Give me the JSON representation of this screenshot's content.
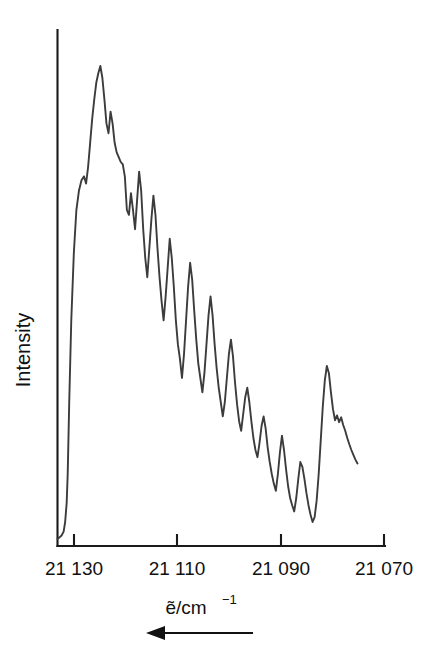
{
  "chart_data": {
    "type": "line",
    "title": "",
    "subtitle": "",
    "xlabel": "ṽ/cm⁻¹",
    "xlabel_base": "ẽ/cm",
    "xlabel_exponent": "−1",
    "ylabel": "Intensity",
    "grid": false,
    "legend": null,
    "annotations": [
      {
        "name": "axis-direction-arrow",
        "text": "",
        "meaning": "arrow pointing left, indicating decreasing wavenumber to the right"
      }
    ],
    "x_axis": {
      "tick_labels": [
        "21 130",
        "21 110",
        "21 090",
        "21 070"
      ],
      "tick_values": [
        21130,
        21110,
        21090,
        21070
      ],
      "reversed": true,
      "xlim": [
        21132,
        21068
      ],
      "units": "cm^-1"
    },
    "y_axis": {
      "ylim": [
        0,
        1
      ],
      "tick_labels": [],
      "units": "arbitrary"
    },
    "series": [
      {
        "name": "emission-spectrum",
        "color": "#3c3c3c",
        "x": [
          21132.0,
          21131.6,
          21131.2,
          21130.8,
          21130.5,
          21130.2,
          21130.0,
          21129.7,
          21129.3,
          21128.8,
          21128.3,
          21127.8,
          21127.3,
          21126.8,
          21126.4,
          21126.0,
          21125.6,
          21125.2,
          21124.8,
          21124.4,
          21124.0,
          21123.6,
          21123.2,
          21122.8,
          21122.4,
          21122.0,
          21121.6,
          21121.2,
          21120.8,
          21120.4,
          21120.0,
          21119.6,
          21119.2,
          21118.8,
          21118.4,
          21118.0,
          21117.6,
          21117.2,
          21116.8,
          21116.4,
          21116.0,
          21115.6,
          21115.2,
          21114.8,
          21114.4,
          21114.0,
          21113.6,
          21113.2,
          21112.8,
          21112.4,
          21112.0,
          21111.6,
          21111.2,
          21110.8,
          21110.4,
          21110.0,
          21109.6,
          21109.2,
          21108.8,
          21108.4,
          21108.0,
          21107.6,
          21107.2,
          21106.8,
          21106.4,
          21106.0,
          21105.6,
          21105.2,
          21104.8,
          21104.4,
          21104.0,
          21103.6,
          21103.2,
          21102.8,
          21102.4,
          21102.0,
          21101.6,
          21101.2,
          21100.8,
          21100.4,
          21100.0,
          21099.6,
          21099.2,
          21098.8,
          21098.4,
          21098.0,
          21097.6,
          21097.2,
          21096.8,
          21096.4,
          21096.0,
          21095.6,
          21095.2,
          21094.8,
          21094.4,
          21094.0,
          21093.6,
          21093.2,
          21092.8,
          21092.4,
          21092.0,
          21091.6,
          21091.2,
          21090.8,
          21090.4,
          21090.0,
          21089.6,
          21089.2,
          21088.8,
          21088.4,
          21088.0,
          21087.6,
          21087.2,
          21086.8,
          21086.4,
          21086.0,
          21085.6,
          21085.2,
          21084.8,
          21084.4,
          21084.0,
          21083.6,
          21083.2,
          21082.8,
          21082.4,
          21082.0,
          21081.6,
          21081.2,
          21080.8,
          21080.4,
          21080.0,
          21079.6,
          21079.2,
          21078.8,
          21078.4,
          21078.0,
          21077.6,
          21077.2,
          21076.8,
          21076.4,
          21076.0,
          21075.6,
          21075.2,
          21074.8,
          21074.4,
          21074.0,
          21073.6,
          21073.2
        ],
        "y": [
          0.015,
          0.018,
          0.022,
          0.03,
          0.05,
          0.09,
          0.15,
          0.3,
          0.47,
          0.61,
          0.7,
          0.74,
          0.762,
          0.77,
          0.755,
          0.79,
          0.84,
          0.89,
          0.93,
          0.965,
          0.985,
          1.0,
          0.975,
          0.93,
          0.88,
          0.86,
          0.905,
          0.88,
          0.84,
          0.82,
          0.81,
          0.8,
          0.795,
          0.77,
          0.7,
          0.69,
          0.735,
          0.7,
          0.66,
          0.72,
          0.78,
          0.74,
          0.66,
          0.6,
          0.56,
          0.62,
          0.68,
          0.73,
          0.69,
          0.62,
          0.56,
          0.51,
          0.47,
          0.52,
          0.58,
          0.64,
          0.6,
          0.54,
          0.47,
          0.42,
          0.39,
          0.35,
          0.4,
          0.47,
          0.54,
          0.59,
          0.555,
          0.49,
          0.43,
          0.38,
          0.35,
          0.32,
          0.36,
          0.42,
          0.48,
          0.52,
          0.48,
          0.42,
          0.37,
          0.33,
          0.3,
          0.27,
          0.3,
          0.35,
          0.4,
          0.43,
          0.395,
          0.34,
          0.295,
          0.26,
          0.24,
          0.275,
          0.31,
          0.33,
          0.3,
          0.26,
          0.225,
          0.2,
          0.185,
          0.215,
          0.25,
          0.27,
          0.245,
          0.205,
          0.175,
          0.15,
          0.13,
          0.115,
          0.15,
          0.195,
          0.23,
          0.2,
          0.16,
          0.125,
          0.1,
          0.085,
          0.072,
          0.1,
          0.14,
          0.175,
          0.165,
          0.14,
          0.11,
          0.085,
          0.065,
          0.05,
          0.06,
          0.095,
          0.15,
          0.22,
          0.29,
          0.345,
          0.375,
          0.36,
          0.32,
          0.285,
          0.262,
          0.272,
          0.258,
          0.268,
          0.252,
          0.24,
          0.225,
          0.212,
          0.2,
          0.19,
          0.18,
          0.172
        ]
      }
    ],
    "features": {
      "main_band_origin": "21 121 cm^-1",
      "max_intensity_position": "21 122 cm^-1",
      "secondary_band_position": "21 079 cm^-1",
      "vibronic_spacing_estimate": "approximately 1.6 cm^-1",
      "baseline_onset": "21 131 cm^-1",
      "trace_end": "21 073 cm^-1"
    }
  }
}
